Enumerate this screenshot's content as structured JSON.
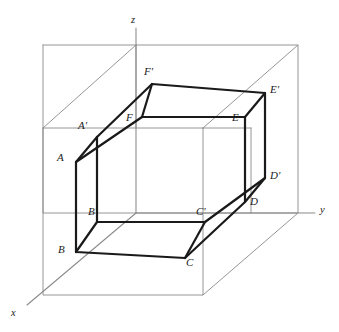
{
  "figure": {
    "colors": {
      "background": "#ffffff",
      "prism_stroke": "#1a1a1a",
      "box_stroke": "#8a8a8a",
      "axis_stroke": "#8a8a8a",
      "label_text": "#1a1a1a"
    },
    "stroke_widths": {
      "prism": 2.2,
      "box": 0.9,
      "axis": 1.0
    }
  },
  "axes": [
    {
      "name": "x",
      "label": "x",
      "label_x": 11,
      "label_y": 308
    },
    {
      "name": "y",
      "label": "y",
      "label_x": 320,
      "label_y": 205
    },
    {
      "name": "z",
      "label": "z",
      "label_x": 131,
      "label_y": 15
    }
  ],
  "vertices": {
    "top_face": [
      {
        "name": "F_prime",
        "label": "F'",
        "x": 152,
        "y": 84,
        "label_x": 144,
        "label_y": 66
      },
      {
        "name": "E_prime",
        "label": "E'",
        "x": 265,
        "y": 93,
        "label_x": 270,
        "label_y": 84
      },
      {
        "name": "D_prime",
        "label": "D'",
        "x": 265,
        "y": 178,
        "label_x": 270,
        "label_y": 170
      },
      {
        "name": "C_prime",
        "label": "C'",
        "x": 205,
        "y": 222,
        "label_x": 196,
        "label_y": 206
      },
      {
        "name": "B_prime",
        "label": "B'",
        "x": 97,
        "y": 222,
        "label_x": 88,
        "label_y": 206
      },
      {
        "name": "A_prime",
        "label": "A'",
        "x": 97,
        "y": 137,
        "label_x": 78,
        "label_y": 120
      }
    ],
    "front_face": [
      {
        "name": "F",
        "label": "F",
        "x": 142,
        "y": 117,
        "label_x": 126,
        "label_y": 112
      },
      {
        "name": "E",
        "label": "E",
        "x": 245,
        "y": 117,
        "label_x": 232,
        "label_y": 112
      },
      {
        "name": "D",
        "label": "D",
        "x": 245,
        "y": 202,
        "label_x": 250,
        "label_y": 196
      },
      {
        "name": "C",
        "label": "C",
        "x": 185,
        "y": 258,
        "label_x": 186,
        "label_y": 257
      },
      {
        "name": "B",
        "label": "B",
        "x": 76,
        "y": 252,
        "label_x": 58,
        "label_y": 244
      },
      {
        "name": "A",
        "label": "A",
        "x": 76,
        "y": 162,
        "label_x": 57,
        "label_y": 152
      }
    ]
  },
  "edges": {
    "hexagon_top_prime": [
      "F_prime",
      "E_prime",
      "D_prime",
      "C_prime",
      "B_prime",
      "A_prime"
    ],
    "hexagon_front": [
      "F",
      "E",
      "D",
      "C",
      "B",
      "A"
    ],
    "connectors": [
      [
        "F_prime",
        "F"
      ],
      [
        "E_prime",
        "E"
      ],
      [
        "D_prime",
        "D"
      ],
      [
        "C_prime",
        "C"
      ],
      [
        "B_prime",
        "B"
      ],
      [
        "A_prime",
        "A"
      ]
    ]
  }
}
